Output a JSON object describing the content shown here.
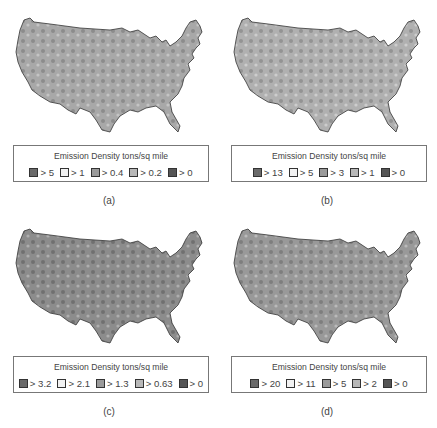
{
  "figure": {
    "panels": [
      {
        "id": "a",
        "caption": "(a)",
        "legend": {
          "title": "Emission Density tons/sq mile",
          "items": [
            {
              "label": "> 5",
              "color": "#6a6a6a"
            },
            {
              "label": "> 1",
              "color": "#f2f2f2"
            },
            {
              "label": "> 0.4",
              "color": "#9a9a9a"
            },
            {
              "label": "> 0.2",
              "color": "#b8b8b8"
            },
            {
              "label": "> 0",
              "color": "#555555"
            }
          ]
        },
        "map_tone": {
          "base": "#a8a8a8",
          "dark": "#7a7a7a",
          "light": "#d0d0d0"
        }
      },
      {
        "id": "b",
        "caption": "(b)",
        "legend": {
          "title": "Emission Density tons/sq mile",
          "items": [
            {
              "label": "> 13",
              "color": "#6a6a6a"
            },
            {
              "label": "> 5",
              "color": "#f2f2f2"
            },
            {
              "label": "> 3",
              "color": "#9a9a9a"
            },
            {
              "label": "> 1",
              "color": "#b8b8b8"
            },
            {
              "label": "> 0",
              "color": "#555555"
            }
          ]
        },
        "map_tone": {
          "base": "#b0b0b0",
          "dark": "#808080",
          "light": "#dadada"
        }
      },
      {
        "id": "c",
        "caption": "(c)",
        "legend": {
          "title": "Emission Density tons/sq mile",
          "items": [
            {
              "label": "> 3.2",
              "color": "#6a6a6a"
            },
            {
              "label": "> 2.1",
              "color": "#f2f2f2"
            },
            {
              "label": "> 1.3",
              "color": "#9a9a9a"
            },
            {
              "label": "> 0.63",
              "color": "#b8b8b8"
            },
            {
              "label": "> 0",
              "color": "#555555"
            }
          ]
        },
        "map_tone": {
          "base": "#8c8c8c",
          "dark": "#5e5e5e",
          "light": "#bcbcbc"
        }
      },
      {
        "id": "d",
        "caption": "(d)",
        "legend": {
          "title": "Emission Density tons/sq mile",
          "items": [
            {
              "label": "> 20",
              "color": "#6a6a6a"
            },
            {
              "label": "> 11",
              "color": "#f2f2f2"
            },
            {
              "label": "> 5",
              "color": "#9a9a9a"
            },
            {
              "label": "> 2",
              "color": "#b8b8b8"
            },
            {
              "label": "> 0",
              "color": "#555555"
            }
          ]
        },
        "map_tone": {
          "base": "#999999",
          "dark": "#6c6c6c",
          "light": "#c8c8c8"
        }
      }
    ]
  }
}
